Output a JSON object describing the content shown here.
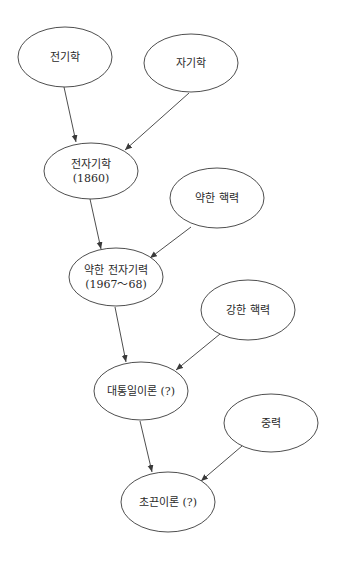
{
  "diagram": {
    "type": "flow-diagram",
    "colors": {
      "line": "#3a3a3a",
      "text": "#2a2a2a",
      "background": "#ffffff"
    },
    "nodes": [
      {
        "id": "electricity",
        "lines": [
          "전기학"
        ],
        "cx": 65,
        "cy": 57,
        "rx": 47,
        "ry": 30
      },
      {
        "id": "magnetism",
        "lines": [
          "자기학"
        ],
        "cx": 191,
        "cy": 63,
        "rx": 47,
        "ry": 29
      },
      {
        "id": "electromagnetism",
        "lines": [
          "전자기학",
          "(1860)"
        ],
        "cx": 91,
        "cy": 171,
        "rx": 47,
        "ry": 28
      },
      {
        "id": "weak-nuclear-force",
        "lines": [
          "약한 핵력"
        ],
        "cx": 217,
        "cy": 198,
        "rx": 47,
        "ry": 30
      },
      {
        "id": "electroweak-force",
        "lines": [
          "약한 전자기력",
          "(1967～68)"
        ],
        "cx": 116,
        "cy": 277,
        "rx": 47,
        "ry": 29
      },
      {
        "id": "strong-nuclear-force",
        "lines": [
          "강한 핵력"
        ],
        "cx": 248,
        "cy": 310,
        "rx": 47,
        "ry": 30
      },
      {
        "id": "grand-unified-theory",
        "lines": [
          "대통일이론 (?)"
        ],
        "cx": 141,
        "cy": 391,
        "rx": 47,
        "ry": 29
      },
      {
        "id": "gravity",
        "lines": [
          "중력"
        ],
        "cx": 271,
        "cy": 423,
        "rx": 47,
        "ry": 29
      },
      {
        "id": "superstring-theory",
        "lines": [
          "초끈이론 (?)"
        ],
        "cx": 168,
        "cy": 502,
        "rx": 47,
        "ry": 30
      }
    ],
    "edges": [
      {
        "from": "electricity",
        "to": "electromagnetism",
        "x1": 64,
        "y1": 87,
        "x2": 76,
        "y2": 142
      },
      {
        "from": "magnetism",
        "to": "electromagnetism",
        "x1": 189,
        "y1": 93,
        "x2": 125,
        "y2": 150
      },
      {
        "from": "electromagnetism",
        "to": "electroweak-force",
        "x1": 90,
        "y1": 199,
        "x2": 101,
        "y2": 249
      },
      {
        "from": "weak-nuclear-force",
        "to": "electroweak-force",
        "x1": 191,
        "y1": 227,
        "x2": 150,
        "y2": 258
      },
      {
        "from": "electroweak-force",
        "to": "grand-unified-theory",
        "x1": 115,
        "y1": 307,
        "x2": 126,
        "y2": 362
      },
      {
        "from": "strong-nuclear-force",
        "to": "grand-unified-theory",
        "x1": 220,
        "y1": 334,
        "x2": 176,
        "y2": 370
      },
      {
        "from": "grand-unified-theory",
        "to": "superstring-theory",
        "x1": 140,
        "y1": 421,
        "x2": 152,
        "y2": 472
      },
      {
        "from": "gravity",
        "to": "superstring-theory",
        "x1": 242,
        "y1": 446,
        "x2": 201,
        "y2": 481
      }
    ]
  }
}
